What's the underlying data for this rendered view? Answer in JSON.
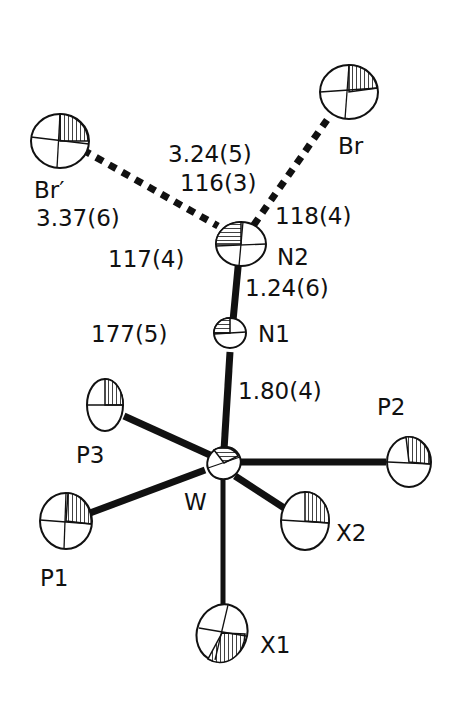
{
  "figure": {
    "type": "ORTEP molecular structure drawing",
    "atoms": {
      "Br_prime": "Br′",
      "Br": "Br",
      "N2": "N2",
      "N1": "N1",
      "W": "W",
      "P1": "P1",
      "P2": "P2",
      "P3": "P3",
      "X1": "X1",
      "X2": "X2"
    },
    "measurements": {
      "n2_br_distance": "3.24(5)",
      "n2_brprime_distance": "3.37(6)",
      "br_n2_brprime_angle": "116(3)",
      "n1_n2_br_angle": "118(4)",
      "n1_n2_brprime_angle": "117(4)",
      "n1_n2_distance": "1.24(6)",
      "w_n1_n2_angle": "177(5)",
      "w_n1_distance": "1.80(4)"
    }
  }
}
